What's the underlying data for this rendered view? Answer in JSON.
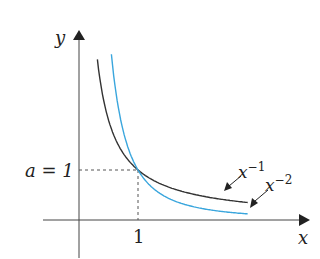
{
  "chart_data": {
    "type": "line",
    "title": "",
    "xlabel": "x",
    "ylabel": "y",
    "xlim": [
      -0.6,
      3.9
    ],
    "ylim": [
      -0.8,
      3.8
    ],
    "series": [
      {
        "name": "x^-1",
        "label_base": "x",
        "label_exp": "−1",
        "color": "#333333",
        "function": "power",
        "exponent": -1,
        "x_range": [
          0.29,
          2.86
        ]
      },
      {
        "name": "x^-2",
        "label_base": "x",
        "label_exp": "−2",
        "color": "#3aa6dd",
        "function": "power",
        "exponent": -2,
        "x_range": [
          0.49,
          2.86
        ]
      }
    ],
    "annotations": {
      "a_label": "a = 1",
      "x_tick": "1",
      "point": [
        1,
        1
      ]
    }
  }
}
